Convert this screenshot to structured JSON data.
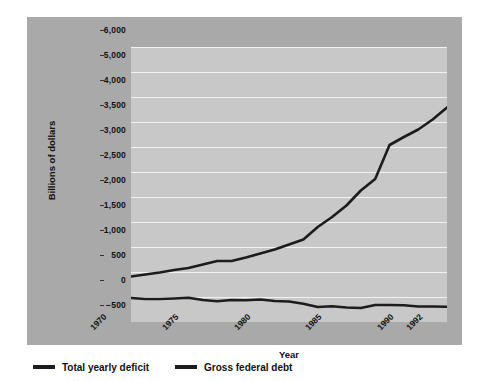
{
  "chart_data": {
    "type": "line",
    "title": "",
    "xlabel": "Year",
    "ylabel": "Billions of dollars",
    "xlim": [
      1970,
      1992
    ],
    "ylim": [
      -500,
      6000
    ],
    "grid": true,
    "legend_position": "bottom-left",
    "x_tick_labels": [
      "1970",
      "1975",
      "1980",
      "1985",
      "1990",
      "1992"
    ],
    "x_tick_values": [
      1970,
      1975,
      1980,
      1985,
      1990,
      1992
    ],
    "y_tick_labels": [
      "6,000",
      "5,000",
      "4,000",
      "3,500",
      "3,000",
      "2,500",
      "2,000",
      "1,500",
      "1,000",
      "500",
      "0",
      "-500"
    ],
    "y_tick_values": [
      6000,
      5000,
      4000,
      3500,
      3000,
      2500,
      2000,
      1500,
      1000,
      500,
      0,
      -500
    ],
    "x": [
      1970,
      1971,
      1972,
      1973,
      1974,
      1975,
      1976,
      1977,
      1978,
      1979,
      1980,
      1981,
      1982,
      1983,
      1984,
      1985,
      1986,
      1987,
      1988,
      1989,
      1990,
      1991,
      1992
    ],
    "series": [
      {
        "name": "Total yearly deficit",
        "color": "#1c1c1c",
        "values": [
          -20,
          -40,
          -40,
          -30,
          -15,
          -60,
          -85,
          -60,
          -65,
          -50,
          -80,
          -90,
          -135,
          -200,
          -185,
          -210,
          -220,
          -160,
          -160,
          -165,
          -190,
          -190,
          -195
        ]
      },
      {
        "name": "Gross federal debt",
        "color": "#1c1c1c",
        "values": [
          410,
          450,
          490,
          540,
          580,
          650,
          720,
          720,
          790,
          870,
          950,
          1050,
          1150,
          1400,
          1600,
          1830,
          2130,
          2360,
          3040,
          3200,
          3350,
          3550,
          3790
        ]
      }
    ]
  },
  "legend": {
    "items": [
      {
        "label": "Total yearly deficit"
      },
      {
        "label": "Gross federal debt"
      }
    ]
  }
}
